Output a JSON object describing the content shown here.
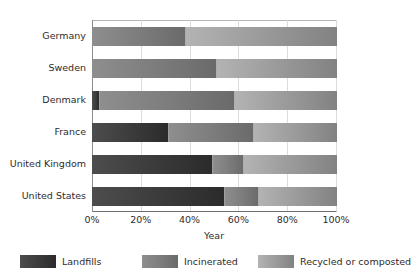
{
  "chart_data": {
    "type": "bar",
    "orientation": "horizontal",
    "stacked": true,
    "stack_mode": "percent",
    "title": "",
    "xlabel": "Year",
    "ylabel": "",
    "xlim": [
      0,
      100
    ],
    "xticks": [
      "0%",
      "20%",
      "40%",
      "60%",
      "80%",
      "100%"
    ],
    "xtick_values": [
      0,
      20,
      40,
      60,
      80,
      100
    ],
    "grid": "vertical",
    "legend_position": "bottom",
    "categories": [
      "Germany",
      "Sweden",
      "Denmark",
      "France",
      "United Kingdom",
      "United States"
    ],
    "series": [
      {
        "name": "Landfills",
        "color": "#3a3a3a",
        "values": [
          0,
          0,
          3,
          31,
          49,
          54
        ]
      },
      {
        "name": "Incinerated",
        "color": "#7d7d7d",
        "values": [
          38,
          51,
          55,
          35,
          13,
          14
        ]
      },
      {
        "name": "Recycled or composted",
        "color": "#9d9d9d",
        "values": [
          62,
          49,
          42,
          34,
          38,
          32
        ]
      }
    ]
  },
  "axis": {
    "x_title": "Year",
    "ticks": [
      {
        "label": "0%",
        "value": 0
      },
      {
        "label": "20%",
        "value": 20
      },
      {
        "label": "40%",
        "value": 40
      },
      {
        "label": "60%",
        "value": 60
      },
      {
        "label": "80%",
        "value": 80
      },
      {
        "label": "100%",
        "value": 100
      }
    ]
  },
  "categories": [
    {
      "label": "Germany"
    },
    {
      "label": "Sweden"
    },
    {
      "label": "Denmark"
    },
    {
      "label": "France"
    },
    {
      "label": "United Kingdom"
    },
    {
      "label": "United States"
    }
  ],
  "legend": {
    "items": [
      {
        "label": "Landfills",
        "color": "#3a3a3a"
      },
      {
        "label": "Incinerated",
        "color": "#7d7d7d"
      },
      {
        "label": "Recycled or composted",
        "color": "#9d9d9d"
      }
    ]
  }
}
